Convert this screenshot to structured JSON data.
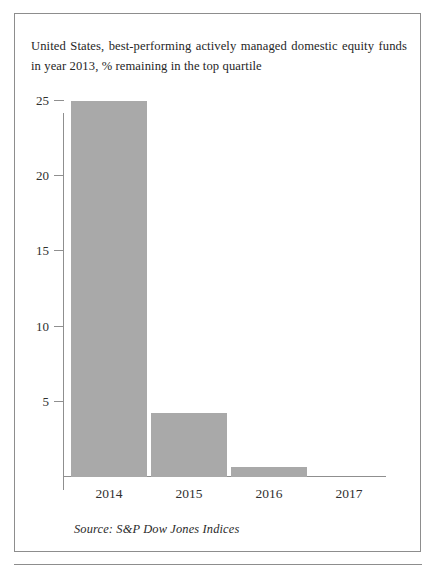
{
  "figure": {
    "title": "United States, best-performing actively managed domestic equity funds in year 2013, % remaining in the top quartile",
    "source": "Source: S&P Dow Jones Indices"
  },
  "chart_data": {
    "type": "bar",
    "title": "United States, best-performing actively managed domestic equity funds in year 2013, % remaining in the top quartile",
    "categories": [
      "2014",
      "2015",
      "2016",
      "2017"
    ],
    "values": [
      25.0,
      4.2,
      0.6,
      0.0
    ],
    "series": [
      {
        "name": "% remaining in the top quartile",
        "values": [
          25.0,
          4.2,
          0.6,
          0.0
        ]
      }
    ],
    "xlabel": "",
    "ylabel": "",
    "ylim": [
      0,
      25
    ],
    "yticks": [
      5,
      10,
      15,
      20,
      25
    ],
    "ytick_labels": [
      "5",
      "10",
      "15",
      "20",
      "25"
    ],
    "grid": false,
    "legend": false,
    "bar_color": "#a9a9a9",
    "axis_color": "#8f8f8f",
    "source": "Source: S&P Dow Jones Indices"
  },
  "ticks": {
    "y": [
      "25",
      "20",
      "15",
      "10",
      "5"
    ],
    "x": [
      "2014",
      "2015",
      "2016",
      "2017"
    ]
  }
}
